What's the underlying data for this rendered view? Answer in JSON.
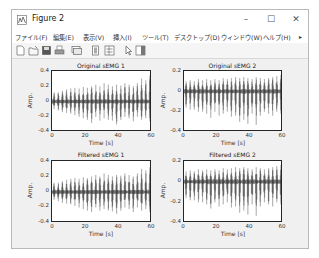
{
  "window": {
    "title": "Figure 2",
    "controls": {
      "minimize": "–",
      "maximize": "☐",
      "close": "✕"
    }
  },
  "menubar": {
    "items": [
      {
        "label": "ファイル(F)"
      },
      {
        "label": "編集(E)"
      },
      {
        "label": "表示(V)"
      },
      {
        "label": "挿入(I)"
      },
      {
        "label": "ツール(T)"
      },
      {
        "label": "デスクトップ(D)"
      },
      {
        "label": "ウィンドウ(W)"
      },
      {
        "label": "ヘルプ(H)"
      }
    ],
    "overflow_icon": "▸"
  },
  "toolbar": {
    "icons": [
      "new-figure-icon",
      "open-file-icon",
      "save-icon",
      "print-icon",
      "link-plot-icon",
      "insert-colorbar-icon",
      "insert-legend-icon",
      "edit-plot-arrow-icon",
      "property-inspector-icon"
    ]
  },
  "chart_data": [
    {
      "type": "line",
      "title": "Original sEMG 1",
      "xlabel": "Time [s]",
      "ylabel": "Amp.",
      "xlim": [
        0,
        60
      ],
      "ylim": [
        -0.4,
        0.4
      ],
      "xticks": [
        "0",
        "20",
        "40",
        "60"
      ],
      "yticks": [
        "0.4",
        "0.2",
        "0",
        "-0.2",
        "-0.4"
      ],
      "bursts": 24,
      "burst_peak_pos": [
        0.12,
        0.12,
        0.14,
        0.16,
        0.17,
        0.18,
        0.17,
        0.19,
        0.18,
        0.2,
        0.22,
        0.2,
        0.24,
        0.22,
        0.2,
        0.22,
        0.21,
        0.24,
        0.22,
        0.2,
        0.24,
        0.3,
        0.28,
        0.34
      ],
      "burst_peak_neg": [
        -0.1,
        -0.12,
        -0.14,
        -0.15,
        -0.16,
        -0.18,
        -0.2,
        -0.22,
        -0.24,
        -0.28,
        -0.2,
        -0.25,
        -0.22,
        -0.24,
        -0.25,
        -0.3,
        -0.24,
        -0.2,
        -0.22,
        -0.26,
        -0.2,
        -0.24,
        -0.22,
        -0.26
      ]
    },
    {
      "type": "line",
      "title": "Original sEMG 2",
      "xlabel": "Time [s]",
      "ylabel": "Amp.",
      "xlim": [
        0,
        60
      ],
      "ylim": [
        -0.4,
        0.2
      ],
      "xticks": [
        "0",
        "20",
        "40",
        "60"
      ],
      "yticks": [
        "0.2",
        "0",
        "-0.2",
        "-0.4"
      ],
      "bursts": 24,
      "burst_peak_pos": [
        0.1,
        0.11,
        0.1,
        0.12,
        0.11,
        0.12,
        0.11,
        0.12,
        0.11,
        0.13,
        0.12,
        0.13,
        0.14,
        0.13,
        0.14,
        0.13,
        0.12,
        0.14,
        0.13,
        0.12,
        0.13,
        0.14,
        0.15,
        0.16
      ],
      "burst_peak_neg": [
        -0.16,
        -0.18,
        -0.18,
        -0.2,
        -0.2,
        -0.22,
        -0.26,
        -0.2,
        -0.24,
        -0.22,
        -0.2,
        -0.25,
        -0.24,
        -0.3,
        -0.28,
        -0.32,
        -0.22,
        -0.33,
        -0.24,
        -0.2,
        -0.22,
        -0.24,
        -0.2,
        -0.22
      ]
    },
    {
      "type": "line",
      "title": "Filtered sEMG 1",
      "xlabel": "Time [s]",
      "ylabel": "Amp.",
      "xlim": [
        0,
        60
      ],
      "ylim": [
        -0.4,
        0.4
      ],
      "xticks": [
        "0",
        "20",
        "40",
        "60"
      ],
      "yticks": [
        "0.4",
        "0.2",
        "0",
        "-0.2",
        "-0.4"
      ],
      "bursts": 24,
      "burst_peak_pos": [
        0.12,
        0.12,
        0.14,
        0.16,
        0.17,
        0.18,
        0.17,
        0.19,
        0.18,
        0.2,
        0.22,
        0.2,
        0.24,
        0.22,
        0.2,
        0.22,
        0.21,
        0.24,
        0.22,
        0.2,
        0.24,
        0.3,
        0.28,
        0.32
      ],
      "burst_peak_neg": [
        -0.1,
        -0.12,
        -0.14,
        -0.15,
        -0.16,
        -0.18,
        -0.2,
        -0.22,
        -0.24,
        -0.26,
        -0.2,
        -0.24,
        -0.22,
        -0.24,
        -0.25,
        -0.28,
        -0.24,
        -0.2,
        -0.22,
        -0.26,
        -0.2,
        -0.24,
        -0.22,
        -0.26
      ]
    },
    {
      "type": "line",
      "title": "Filtered sEMG 2",
      "xlabel": "Time [s]",
      "ylabel": "Amp.",
      "xlim": [
        0,
        60
      ],
      "ylim": [
        -0.4,
        0.2
      ],
      "xticks": [
        "0",
        "20",
        "40",
        "60"
      ],
      "yticks": [
        "0.2",
        "0",
        "-0.2",
        "-0.4"
      ],
      "bursts": 24,
      "burst_peak_pos": [
        0.1,
        0.11,
        0.1,
        0.12,
        0.11,
        0.12,
        0.11,
        0.12,
        0.11,
        0.13,
        0.12,
        0.13,
        0.14,
        0.13,
        0.14,
        0.13,
        0.12,
        0.14,
        0.13,
        0.12,
        0.13,
        0.14,
        0.15,
        0.16
      ],
      "burst_peak_neg": [
        -0.16,
        -0.18,
        -0.18,
        -0.2,
        -0.2,
        -0.22,
        -0.26,
        -0.2,
        -0.24,
        -0.22,
        -0.2,
        -0.25,
        -0.24,
        -0.3,
        -0.28,
        -0.32,
        -0.22,
        -0.33,
        -0.24,
        -0.2,
        -0.22,
        -0.24,
        -0.2,
        -0.22
      ]
    }
  ],
  "colors": {
    "signal": "#3a3a3a",
    "axes": "#262626",
    "figure_bg": "#f0f0f0"
  }
}
